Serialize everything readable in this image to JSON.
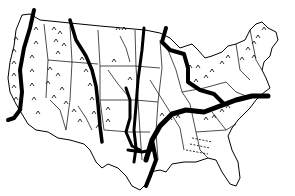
{
  "map": {
    "subject": "contiguous-united-states",
    "style": "hand-drawn black ink on white",
    "colors": {
      "background": "#ffffff",
      "ink": "#000000"
    },
    "features": {
      "thick_lines": [
        {
          "id": "pacific-coast-line",
          "width": 4
        },
        {
          "id": "sierra-cascade-line",
          "width": 4
        },
        {
          "id": "rocky-front-line",
          "width": 3
        },
        {
          "id": "central-plains-line-a",
          "width": 3
        },
        {
          "id": "central-plains-line-b",
          "width": 3
        },
        {
          "id": "great-lakes-line",
          "width": 4
        },
        {
          "id": "ohio-tennessee-line",
          "width": 5
        },
        {
          "id": "south-branch-line",
          "width": 4
        }
      ],
      "symbols": [
        "mountain-marks",
        "river-lines",
        "state-borders",
        "dashed-hatch-southeast"
      ]
    },
    "labels": []
  }
}
